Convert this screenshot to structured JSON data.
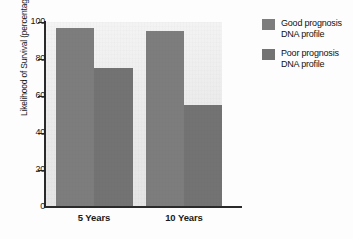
{
  "chart_data": {
    "type": "bar",
    "title": "",
    "xlabel": "",
    "ylabel": "Likelihood of Survival (percentage)",
    "ylim": [
      0,
      100
    ],
    "yticks": [
      "0",
      "20",
      "40",
      "60",
      "80",
      "100"
    ],
    "grid": false,
    "legend_position": "right",
    "categories": [
      "5 Years",
      "10 Years"
    ],
    "series": [
      {
        "name": "Good prognosis\nDNA profile",
        "color": "#7d7d7d",
        "values": [
          97,
          95
        ]
      },
      {
        "name": "Poor prognosis\nDNA profile",
        "color": "#737373",
        "values": [
          75,
          55
        ]
      }
    ]
  },
  "axis": {
    "y_title": "Likelihood of Survival (percentage)",
    "ticks": [
      {
        "label": "100",
        "value": 100
      },
      {
        "label": "80",
        "value": 80
      },
      {
        "label": "60",
        "value": 60
      },
      {
        "label": "40",
        "value": 40
      },
      {
        "label": "20",
        "value": 20
      },
      {
        "label": "0",
        "value": 0
      }
    ],
    "x_labels": [
      "5 Years",
      "10 Years"
    ]
  },
  "legend": {
    "entries": [
      {
        "label": "Good prognosis\nDNA profile",
        "color": "#7d7d7d"
      },
      {
        "label": "Poor prognosis\nDNA profile",
        "color": "#737373"
      }
    ]
  },
  "bars": [
    {
      "group": "5 Years",
      "series": "Good prognosis DNA profile",
      "value": 97
    },
    {
      "group": "5 Years",
      "series": "Poor prognosis DNA profile",
      "value": 75
    },
    {
      "group": "10 Years",
      "series": "Good prognosis DNA profile",
      "value": 95
    },
    {
      "group": "10 Years",
      "series": "Poor prognosis DNA profile",
      "value": 55
    }
  ]
}
